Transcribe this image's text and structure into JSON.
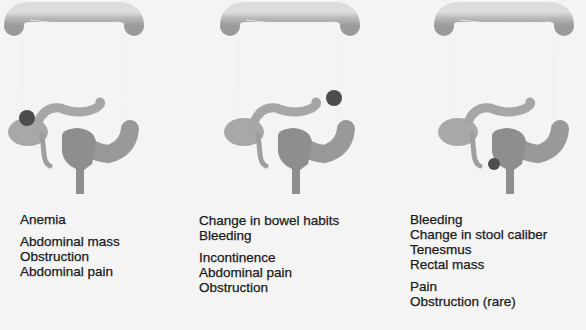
{
  "colors": {
    "background": "#f4f4f4",
    "colon_light": "#d4d4d4",
    "colon_mid": "#b8b8b8",
    "colon_dark": "#999999",
    "rectum": "#8e8e8e",
    "tumor": "#4d4d4d",
    "text": "#1a1a1a"
  },
  "panels": [
    {
      "tumor_location": "right colon (cecum/ascending)",
      "symptoms": [
        "Anemia",
        "Abdominal mass",
        "Obstruction",
        "Abdominal pain"
      ],
      "gap_after_index": 0
    },
    {
      "tumor_location": "left colon (descending)",
      "symptoms": [
        "Change in bowel habits",
        "Bleeding",
        "Incontinence",
        "Abdominal pain",
        "Obstruction"
      ],
      "gap_after_index": 1
    },
    {
      "tumor_location": "rectum",
      "symptoms": [
        "Bleeding",
        "Change in stool caliber",
        "Tenesmus",
        "Rectal mass",
        "Pain",
        "Obstruction (rare)"
      ],
      "gap_after_index": 3
    }
  ]
}
